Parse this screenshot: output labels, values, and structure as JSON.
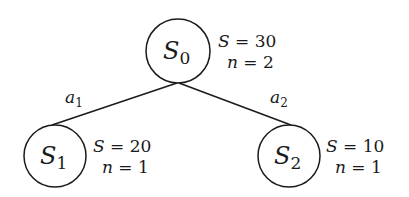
{
  "diagram": {
    "type": "tree",
    "nodes": [
      {
        "id": "S0",
        "label": "S",
        "subscript": "0",
        "stats": {
          "S_label": "S = ",
          "S_value": "30",
          "n_label": "n = ",
          "n_value": "2"
        },
        "cx": 178,
        "cy": 51,
        "r": 32
      },
      {
        "id": "S1",
        "label": "S",
        "subscript": "1",
        "stats": {
          "S_label": "S = ",
          "S_value": "20",
          "n_label": "n = ",
          "n_value": "1"
        },
        "cx": 55,
        "cy": 156,
        "r": 31
      },
      {
        "id": "S2",
        "label": "S",
        "subscript": "2",
        "stats": {
          "S_label": "S = ",
          "S_value": "10",
          "n_label": "n = ",
          "n_value": "1"
        },
        "cx": 289,
        "cy": 156,
        "r": 31
      }
    ],
    "edges": [
      {
        "from": "S0",
        "to": "S1",
        "label": "a",
        "subscript": "1"
      },
      {
        "from": "S0",
        "to": "S2",
        "label": "a",
        "subscript": "2"
      }
    ],
    "colors": {
      "stroke": "#1a1a1a",
      "background": "#ffffff"
    }
  }
}
